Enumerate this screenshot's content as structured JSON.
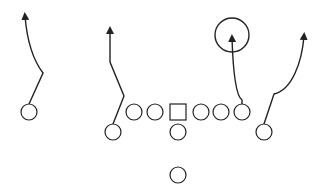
{
  "diagram": {
    "type": "football-play",
    "background": "#ffffff",
    "stroke_color": "#222222",
    "players": [
      {
        "id": "left-wr",
        "shape": "circle",
        "cx": 29,
        "cy": 112,
        "r": 8
      },
      {
        "id": "slot",
        "shape": "circle",
        "cx": 113,
        "cy": 132,
        "r": 8
      },
      {
        "id": "lt",
        "shape": "circle",
        "cx": 134,
        "cy": 112,
        "r": 8
      },
      {
        "id": "lg",
        "shape": "circle",
        "cx": 155,
        "cy": 112,
        "r": 8
      },
      {
        "id": "center",
        "shape": "square",
        "cx": 178,
        "cy": 112,
        "size": 16
      },
      {
        "id": "rg",
        "shape": "circle",
        "cx": 201,
        "cy": 112,
        "r": 8
      },
      {
        "id": "rt",
        "shape": "circle",
        "cx": 221,
        "cy": 112,
        "r": 8
      },
      {
        "id": "te",
        "shape": "circle",
        "cx": 242,
        "cy": 112,
        "r": 8
      },
      {
        "id": "qb",
        "shape": "circle",
        "cx": 178,
        "cy": 132,
        "r": 8
      },
      {
        "id": "rb",
        "shape": "circle",
        "cx": 178,
        "cy": 175,
        "r": 8
      },
      {
        "id": "right-wr",
        "shape": "circle",
        "cx": 264,
        "cy": 132,
        "r": 8
      }
    ],
    "routes": [
      {
        "id": "route-left-wr",
        "d": "M29,104 L43,73 C33,60 27,40 25,16"
      },
      {
        "id": "route-slot",
        "d": "M113,124 L124,96 L110,62 L110,30"
      },
      {
        "id": "route-te",
        "d": "M242,104 L242,100 C236,96 233,70 232,38"
      },
      {
        "id": "route-right-wr",
        "d": "M264,124 L274,94 C292,90 302,62 304,36"
      }
    ],
    "zones": [
      {
        "id": "target-zone",
        "shape": "circle",
        "cx": 232,
        "cy": 35,
        "r": 17
      }
    ]
  }
}
